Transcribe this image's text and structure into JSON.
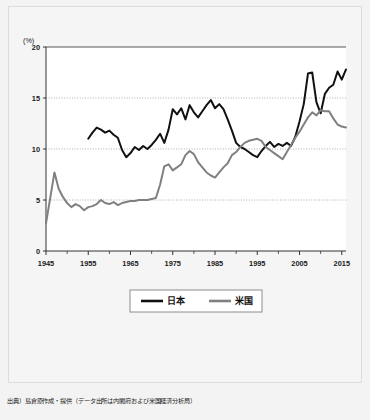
{
  "figure": {
    "source_note": "出典）島倉原作成・提供（データ出所は内閣府および米国経済分析局）",
    "y_unit_label": "(%)"
  },
  "chart_data": {
    "type": "line",
    "title": "",
    "subtitle": "",
    "xlabel": "",
    "ylabel": "(%)",
    "xlim": [
      1945,
      2016
    ],
    "ylim": [
      0,
      20
    ],
    "y_ticks": [
      0,
      5,
      10,
      15,
      20
    ],
    "y_tick_labels": [
      "0",
      "5",
      "10",
      "15",
      "20"
    ],
    "x_ticks": [
      1945,
      1955,
      1965,
      1975,
      1985,
      1995,
      2005,
      2015
    ],
    "x_tick_labels": [
      "1945",
      "1955",
      "1965",
      "1975",
      "1985",
      "1995",
      "2005",
      "2015"
    ],
    "x_minor_tick_interval": 5,
    "grid": "horizontal-dotted",
    "legend_position": "below-center",
    "series": [
      {
        "name": "日本",
        "color": "#111111",
        "line_width": 2.0,
        "x": [
          1955,
          1956,
          1957,
          1958,
          1959,
          1960,
          1961,
          1962,
          1963,
          1964,
          1965,
          1966,
          1967,
          1968,
          1969,
          1970,
          1971,
          1972,
          1973,
          1974,
          1975,
          1976,
          1977,
          1978,
          1979,
          1980,
          1981,
          1982,
          1983,
          1984,
          1985,
          1986,
          1987,
          1988,
          1989,
          1990,
          1991,
          1992,
          1993,
          1994,
          1995,
          1996,
          1997,
          1998,
          1999,
          2000,
          2001,
          2002,
          2003,
          2004,
          2005,
          2006,
          2007,
          2008,
          2009,
          2010,
          2011,
          2012,
          2013,
          2014,
          2015,
          2016
        ],
        "values": [
          11.0,
          11.6,
          12.1,
          11.9,
          11.6,
          11.8,
          11.4,
          11.1,
          9.9,
          9.2,
          9.6,
          10.2,
          9.9,
          10.3,
          10.0,
          10.4,
          10.9,
          11.5,
          10.6,
          11.9,
          13.9,
          13.4,
          14.0,
          12.9,
          14.3,
          13.6,
          13.1,
          13.7,
          14.3,
          14.8,
          14.0,
          14.4,
          13.9,
          12.9,
          11.8,
          10.6,
          10.2,
          10.0,
          9.7,
          9.4,
          9.2,
          9.8,
          10.3,
          10.7,
          10.2,
          10.5,
          10.3,
          10.6,
          10.3,
          11.2,
          12.7,
          14.4,
          17.4,
          17.5,
          14.6,
          13.5,
          15.4,
          16.0,
          16.3,
          17.6,
          16.8,
          17.8
        ]
      },
      {
        "name": "米国",
        "color": "#808080",
        "line_width": 2.0,
        "x": [
          1945,
          1946,
          1947,
          1948,
          1949,
          1950,
          1951,
          1952,
          1953,
          1954,
          1955,
          1956,
          1957,
          1958,
          1959,
          1960,
          1961,
          1962,
          1963,
          1964,
          1965,
          1966,
          1967,
          1968,
          1969,
          1970,
          1971,
          1972,
          1973,
          1974,
          1975,
          1976,
          1977,
          1978,
          1979,
          1980,
          1981,
          1982,
          1983,
          1984,
          1985,
          1986,
          1987,
          1988,
          1989,
          1990,
          1991,
          1992,
          1993,
          1994,
          1995,
          1996,
          1997,
          1998,
          1999,
          2000,
          2001,
          2002,
          2003,
          2004,
          2005,
          2006,
          2007,
          2008,
          2009,
          2010,
          2011,
          2012,
          2013,
          2014,
          2015,
          2016
        ],
        "values": [
          2.7,
          5.2,
          7.7,
          6.1,
          5.3,
          4.7,
          4.3,
          4.6,
          4.4,
          4.0,
          4.3,
          4.4,
          4.6,
          5.0,
          4.7,
          4.6,
          4.8,
          4.5,
          4.7,
          4.8,
          4.9,
          4.9,
          5.0,
          5.0,
          5.0,
          5.1,
          5.2,
          6.5,
          8.3,
          8.5,
          7.9,
          8.2,
          8.5,
          9.4,
          9.8,
          9.5,
          8.7,
          8.2,
          7.7,
          7.4,
          7.2,
          7.7,
          8.2,
          8.6,
          9.4,
          9.7,
          10.2,
          10.6,
          10.8,
          10.9,
          11.0,
          10.8,
          10.2,
          9.9,
          9.6,
          9.3,
          9.0,
          9.7,
          10.4,
          11.1,
          11.7,
          12.4,
          13.1,
          13.6,
          13.3,
          13.8,
          13.7,
          13.7,
          13.0,
          12.4,
          12.2,
          12.1
        ]
      }
    ],
    "legend": [
      {
        "label": "日本",
        "color": "#111111"
      },
      {
        "label": "米国",
        "color": "#808080"
      }
    ]
  }
}
